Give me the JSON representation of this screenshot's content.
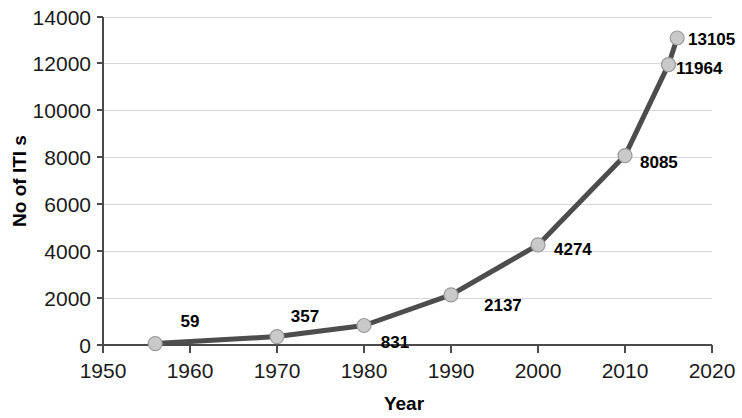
{
  "chart_data": {
    "type": "line",
    "title": "",
    "xlabel": "Year",
    "ylabel": "No of ITI s",
    "xlim": [
      1950,
      2020
    ],
    "ylim": [
      0,
      14000
    ],
    "grid": true,
    "legend": "none",
    "x_ticks": [
      "1950",
      "1960",
      "1970",
      "1980",
      "1990",
      "2000",
      "2010",
      "2020"
    ],
    "y_ticks": [
      "0",
      "2000",
      "4000",
      "6000",
      "8000",
      "10000",
      "12000",
      "14000"
    ],
    "x": [
      1956,
      1970,
      1980,
      1990,
      2000,
      2010,
      2015,
      2016
    ],
    "values": [
      59,
      357,
      831,
      2137,
      4274,
      8085,
      11964,
      13105
    ],
    "point_labels": [
      "59",
      "357",
      "831",
      "2137",
      "4274",
      "8085",
      "11964",
      "13105"
    ],
    "series": [
      {
        "name": "No of ITI s",
        "values": [
          59,
          357,
          831,
          2137,
          4274,
          8085,
          11964,
          13105
        ]
      }
    ],
    "colors": {
      "line": "#4d4d4d",
      "marker_fill": "#c9c9c9",
      "marker_stroke": "#9a9a9a",
      "grid": "#d8d8d8",
      "axis": "#4a4a4a",
      "text": "#000000"
    }
  }
}
